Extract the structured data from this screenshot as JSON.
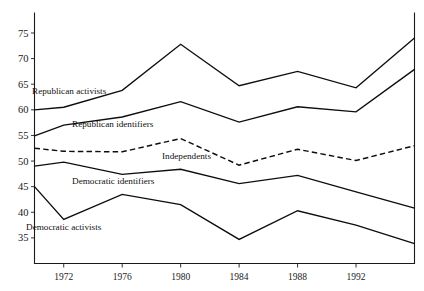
{
  "figure": {
    "top_fragment_text": "",
    "background_color": "#ffffff",
    "line_color": "#0d0d0d"
  },
  "axes": {
    "y_ticks": [
      35,
      40,
      45,
      50,
      55,
      60,
      65,
      70,
      75
    ],
    "x_ticks": [
      1972,
      1976,
      1980,
      1984,
      1988,
      1992
    ],
    "x_range": [
      1970,
      1996
    ],
    "y_range": [
      30,
      79
    ]
  },
  "series_labels": {
    "republican_activists": "Republican activists",
    "republican_identifiers": "Republican identifiers",
    "independents": "Independents",
    "democratic_identifiers": "Democratic identifiers",
    "democratic_activists": "Democratic activists"
  },
  "chart_data": {
    "type": "line",
    "title": "",
    "xlabel": "",
    "ylabel": "",
    "xlim": [
      1970,
      1996
    ],
    "ylim": [
      30,
      79
    ],
    "grid": false,
    "legend": "inline-labels",
    "x": [
      1970,
      1972,
      1976,
      1980,
      1984,
      1988,
      1992,
      1996
    ],
    "series": [
      {
        "name": "Republican activists",
        "style": "solid",
        "values": [
          60.0,
          60.5,
          63.8,
          72.8,
          64.7,
          67.5,
          64.3,
          74.0
        ]
      },
      {
        "name": "Republican identifiers",
        "style": "solid",
        "values": [
          54.9,
          57.0,
          58.6,
          61.6,
          57.6,
          60.6,
          59.6,
          67.9
        ]
      },
      {
        "name": "Independents",
        "style": "dashed",
        "values": [
          52.5,
          51.9,
          51.8,
          54.4,
          49.2,
          52.3,
          50.1,
          53.0
        ]
      },
      {
        "name": "Democratic identifiers",
        "style": "solid",
        "values": [
          49.0,
          49.8,
          47.4,
          48.4,
          45.6,
          47.2,
          44.0,
          40.8
        ]
      },
      {
        "name": "Democratic activists",
        "style": "solid",
        "values": [
          45.0,
          38.6,
          43.5,
          41.5,
          34.7,
          40.3,
          37.5,
          33.9
        ]
      }
    ]
  }
}
